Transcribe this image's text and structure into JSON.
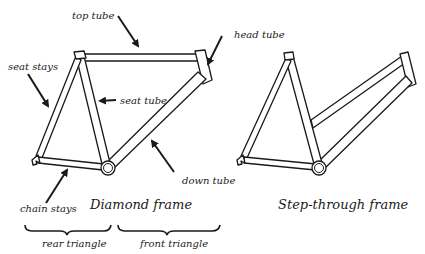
{
  "diagram": {
    "diamond_frame": {
      "title": "Diamond frame",
      "labels": {
        "top_tube": "top tube",
        "head_tube": "head tube",
        "seat_stays": "seat stays",
        "seat_tube": "seat tube",
        "down_tube": "down tube",
        "chain_stays": "chain stays"
      },
      "braces": {
        "rear": "rear triangle",
        "front": "front triangle"
      }
    },
    "step_through_frame": {
      "title": "Step-through frame"
    },
    "colors": {
      "line": "#1a1a1a",
      "background": "#ffffff"
    }
  }
}
